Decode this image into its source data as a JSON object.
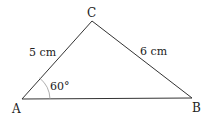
{
  "diagram": {
    "type": "triangle",
    "vertices": [
      {
        "id": "A",
        "label": "A",
        "x": 22,
        "y": 99
      },
      {
        "id": "B",
        "label": "B",
        "x": 192,
        "y": 98
      },
      {
        "id": "C",
        "label": "C",
        "x": 92,
        "y": 21
      }
    ],
    "sides": [
      {
        "from": "A",
        "to": "C",
        "label": "5 cm"
      },
      {
        "from": "C",
        "to": "B",
        "label": "6 cm"
      }
    ],
    "angles": [
      {
        "vertex": "A",
        "label": "60°"
      }
    ],
    "colors": {
      "stroke": "#333333",
      "arc": "#888888",
      "text": "#222222"
    }
  }
}
